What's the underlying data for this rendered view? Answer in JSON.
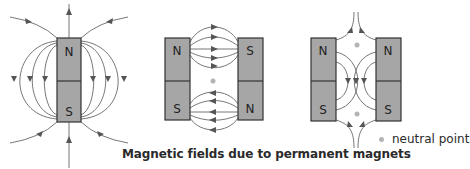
{
  "caption": "Magnetic fields due to permanent magnets",
  "legend": {
    "label": "neutral point",
    "dot_color": "#b4b4b4"
  },
  "diagrams": [
    {
      "id": "single-bar-magnet",
      "poles": {
        "top": "N",
        "bottom": "S"
      }
    },
    {
      "id": "opposite-poles-facing",
      "left": {
        "top": "N",
        "bottom": "S"
      },
      "right": {
        "top": "S",
        "bottom": "N"
      },
      "neutral_points": 1
    },
    {
      "id": "like-poles-facing",
      "left": {
        "top": "N",
        "bottom": "S"
      },
      "right": {
        "top": "N",
        "bottom": "S"
      },
      "neutral_points": 2
    }
  ],
  "colors": {
    "magnet_fill": "#a6a6a6",
    "magnet_stroke": "#333333",
    "field_line": "#666666",
    "neutral_point": "#b4b4b4"
  }
}
